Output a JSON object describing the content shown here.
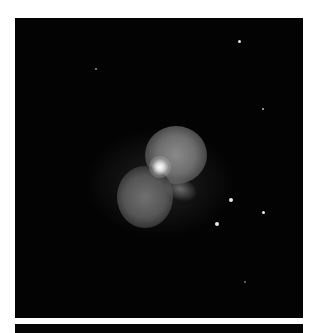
{
  "image": {
    "subject": "nebula",
    "description": "Grayscale astronomical image of a bipolar nebula with bright central star on black background",
    "background_color": "#030303",
    "frame_color": "#ffffff"
  },
  "stars": [
    {
      "x": 239,
      "y": 41,
      "r": 1.5
    },
    {
      "x": 95,
      "y": 69,
      "r": 1
    },
    {
      "x": 263,
      "y": 109,
      "r": 1
    },
    {
      "x": 231,
      "y": 200,
      "r": 2
    },
    {
      "x": 263,
      "y": 212,
      "r": 1.5
    },
    {
      "x": 217,
      "y": 224,
      "r": 2
    },
    {
      "x": 244,
      "y": 281,
      "r": 0.8
    }
  ]
}
